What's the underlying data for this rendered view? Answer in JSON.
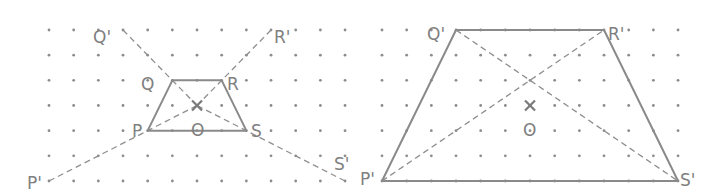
{
  "diagram": {
    "type": "enlargement-on-dot-grid",
    "scale_factor": 3,
    "grid": {
      "columns": 13,
      "rows": 7
    },
    "panels": [
      {
        "name": "construction",
        "origin_px": [
          49,
          30
        ],
        "spacing_px": [
          24.67,
          25.17
        ],
        "object": {
          "P": [
            4,
            4
          ],
          "Q": [
            5,
            2
          ],
          "R": [
            7,
            2
          ],
          "S": [
            8,
            4
          ]
        },
        "image": {
          "P'": [
            0,
            6
          ],
          "Q'": [
            3,
            0
          ],
          "R'": [
            9,
            0
          ],
          "S'": [
            12,
            6
          ]
        },
        "centre": {
          "O": [
            6,
            3
          ]
        },
        "labels": {
          "P": "P",
          "Q": "Q",
          "R": "R",
          "S": "S",
          "O": "O",
          "P_prime": "P'",
          "Q_prime": "Q'",
          "R_prime": "R'",
          "S_prime": "S'"
        }
      },
      {
        "name": "result",
        "origin_px": [
          382,
          30
        ],
        "spacing_px": [
          24.67,
          25.17
        ],
        "image": {
          "P'": [
            0,
            6
          ],
          "Q'": [
            3,
            0
          ],
          "R'": [
            9,
            0
          ],
          "S'": [
            12,
            6
          ]
        },
        "centre": {
          "O": [
            6,
            3
          ]
        },
        "labels": {
          "O": "O",
          "P_prime": "P'",
          "Q_prime": "Q'",
          "R_prime": "R'",
          "S_prime": "S'"
        }
      }
    ],
    "colors": {
      "line": "#8a8a8a",
      "dot": "#8c8c8c",
      "label": "#808080",
      "background": "#ffffff"
    }
  }
}
